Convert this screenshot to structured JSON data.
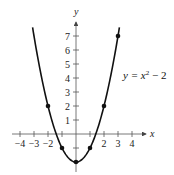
{
  "chart_data": {
    "type": "line",
    "title": "",
    "xlabel": "x",
    "ylabel": "y",
    "xlim": [
      -4,
      4
    ],
    "ylim": [
      -2,
      7
    ],
    "grid": false,
    "x_ticks": [
      -4,
      -3,
      -2,
      2,
      3,
      4
    ],
    "x_tick_labels": [
      "−4",
      "−3",
      "−2",
      "2",
      "3",
      "4"
    ],
    "y_ticks": [
      1,
      2,
      3,
      4,
      5,
      6,
      7
    ],
    "y_tick_labels": [
      "1",
      "2",
      "3",
      "4",
      "5",
      "6",
      "7"
    ],
    "series": [
      {
        "name": "y = x² − 2",
        "equation": "y = x^2 - 2",
        "points": [
          {
            "x": -2,
            "y": 2
          },
          {
            "x": -1,
            "y": -1
          },
          {
            "x": 0,
            "y": -2
          },
          {
            "x": 1,
            "y": -1
          },
          {
            "x": 2,
            "y": 2
          },
          {
            "x": 3,
            "y": 7
          }
        ]
      }
    ],
    "annotations": [
      {
        "text": "y = x² − 2",
        "position": "right of curve near y=4"
      }
    ]
  },
  "labels": {
    "x_axis": "x",
    "y_axis": "y",
    "equation_main": "y = x",
    "equation_exp": "2",
    "equation_tail": " − 2"
  }
}
